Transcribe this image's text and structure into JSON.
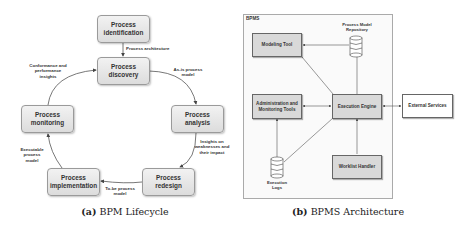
{
  "lifecycle": {
    "caption_prefix": "(a)",
    "caption_text": "BPM Lifecycle",
    "phases": [
      {
        "id": "identification",
        "label": "Process\nidentification"
      },
      {
        "id": "discovery",
        "label": "Process\ndiscovery"
      },
      {
        "id": "analysis",
        "label": "Process\nanalysis"
      },
      {
        "id": "redesign",
        "label": "Process\nredesign"
      },
      {
        "id": "implementation",
        "label": "Process\nimplementation"
      },
      {
        "id": "monitoring",
        "label": "Process\nmonitoring"
      }
    ],
    "edge_labels": {
      "identification_to_discovery": "Process architecture",
      "discovery_to_analysis": "As-is process\nmodel",
      "analysis_to_redesign": "Insights on\nweaknesses and\ntheir impact",
      "redesign_to_implementation": "To-be process\nmodel",
      "implementation_to_monitoring": "Executable\nprocess\nmodel",
      "monitoring_to_discovery": "Conformance and\nperformance\ninsights"
    }
  },
  "architecture": {
    "caption_prefix": "(b)",
    "caption_text": "BPMS Architecture",
    "frame_label": "BPMS",
    "components": {
      "modeling_tool": "Modeling Tool",
      "admin_tools": "Administration and\nMonitoring Tools",
      "execution_engine": "Execution Engine",
      "worklist_handler": "Worklist Handler",
      "external_services": "External Services"
    },
    "stores": {
      "repository": "Process Model\nRepository",
      "logs": "Execution\nLogs"
    }
  },
  "colors": {
    "box_fill": "#dcdcdc",
    "arch_box_fill": "#d9d9d9",
    "line": "#555555"
  }
}
